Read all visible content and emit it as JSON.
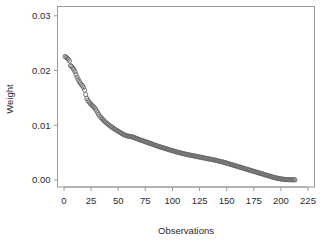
{
  "chart_data": {
    "type": "scatter",
    "title": "",
    "xlabel": "Observations",
    "ylabel": "Weight",
    "xlim": [
      -6,
      231
    ],
    "ylim": [
      -0.0013,
      0.0317
    ],
    "xticks": [
      0,
      25,
      50,
      75,
      100,
      125,
      150,
      175,
      200,
      225
    ],
    "xticklabels": [
      "0",
      "25",
      "50",
      "75",
      "100",
      "125",
      "150",
      "175",
      "200",
      "225"
    ],
    "yticks": [
      0.0,
      0.01,
      0.02,
      0.03
    ],
    "yticklabels": [
      "0.00",
      "0.01",
      "0.02",
      "0.03"
    ],
    "grid": false,
    "legend": null,
    "marker": "open-circle",
    "marker_color": "#6b6b6b",
    "marker_size": 2.1,
    "frame_color": "#9a9a9a",
    "text_color": "#2b2b2b",
    "n_points": 213,
    "x": [
      1,
      2,
      3,
      4,
      5,
      6,
      7,
      8,
      9,
      10,
      11,
      12,
      13,
      14,
      15,
      16,
      17,
      18,
      19,
      20,
      21,
      22,
      23,
      24,
      25,
      26,
      27,
      28,
      29,
      30,
      31,
      32,
      33,
      34,
      35,
      36,
      37,
      38,
      39,
      40,
      41,
      42,
      43,
      44,
      45,
      46,
      47,
      48,
      49,
      50,
      51,
      52,
      53,
      54,
      55,
      56,
      57,
      58,
      59,
      60,
      61,
      62,
      63,
      64,
      65,
      66,
      67,
      68,
      69,
      70,
      71,
      72,
      73,
      74,
      75,
      76,
      77,
      78,
      79,
      80,
      81,
      82,
      83,
      84,
      85,
      86,
      87,
      88,
      89,
      90,
      91,
      92,
      93,
      94,
      95,
      96,
      97,
      98,
      99,
      100,
      101,
      102,
      103,
      104,
      105,
      106,
      107,
      108,
      109,
      110,
      111,
      112,
      113,
      114,
      115,
      116,
      117,
      118,
      119,
      120,
      121,
      122,
      123,
      124,
      125,
      126,
      127,
      128,
      129,
      130,
      131,
      132,
      133,
      134,
      135,
      136,
      137,
      138,
      139,
      140,
      141,
      142,
      143,
      144,
      145,
      146,
      147,
      148,
      149,
      150,
      151,
      152,
      153,
      154,
      155,
      156,
      157,
      158,
      159,
      160,
      161,
      162,
      163,
      164,
      165,
      166,
      167,
      168,
      169,
      170,
      171,
      172,
      173,
      174,
      175,
      176,
      177,
      178,
      179,
      180,
      181,
      182,
      183,
      184,
      185,
      186,
      187,
      188,
      189,
      190,
      191,
      192,
      193,
      194,
      195,
      196,
      197,
      198,
      199,
      200,
      201,
      202,
      203,
      204,
      205,
      206,
      207,
      208,
      209,
      210,
      211,
      212,
      213
    ],
    "y": [
      0.02255,
      0.0224,
      0.02225,
      0.02205,
      0.02175,
      0.0209,
      0.02075,
      0.0205,
      0.0202,
      0.0198,
      0.0193,
      0.0188,
      0.0184,
      0.018,
      0.0177,
      0.01745,
      0.0172,
      0.0169,
      0.0164,
      0.0156,
      0.0149,
      0.01455,
      0.01425,
      0.014,
      0.0138,
      0.0136,
      0.0134,
      0.0132,
      0.01295,
      0.01265,
      0.0123,
      0.01195,
      0.01165,
      0.0114,
      0.0112,
      0.011,
      0.0108,
      0.0106,
      0.01042,
      0.01026,
      0.0101,
      0.00995,
      0.0098,
      0.00966,
      0.00952,
      0.00938,
      0.00925,
      0.00912,
      0.009,
      0.00888,
      0.00876,
      0.00864,
      0.00852,
      0.00841,
      0.0083,
      0.0082,
      0.00812,
      0.00806,
      0.00802,
      0.00798,
      0.00794,
      0.0079,
      0.00786,
      0.0078,
      0.00772,
      0.00764,
      0.00756,
      0.00748,
      0.0074,
      0.00733,
      0.00726,
      0.00719,
      0.00712,
      0.00705,
      0.00698,
      0.00691,
      0.00684,
      0.00677,
      0.0067,
      0.00663,
      0.00656,
      0.00649,
      0.00642,
      0.00635,
      0.00628,
      0.00621,
      0.00614,
      0.00607,
      0.006,
      0.00594,
      0.00588,
      0.00582,
      0.00576,
      0.0057,
      0.00564,
      0.00558,
      0.00552,
      0.00546,
      0.0054,
      0.00534,
      0.00528,
      0.00522,
      0.00516,
      0.0051,
      0.00505,
      0.005,
      0.00495,
      0.0049,
      0.00485,
      0.0048,
      0.00475,
      0.0047,
      0.00466,
      0.00462,
      0.00458,
      0.00454,
      0.0045,
      0.00446,
      0.00442,
      0.00438,
      0.00434,
      0.0043,
      0.00426,
      0.00422,
      0.00418,
      0.00414,
      0.0041,
      0.00406,
      0.00402,
      0.00398,
      0.00394,
      0.0039,
      0.00386,
      0.00382,
      0.00378,
      0.00374,
      0.0037,
      0.00366,
      0.00362,
      0.00358,
      0.00353,
      0.00348,
      0.00343,
      0.00338,
      0.00333,
      0.00328,
      0.00323,
      0.00318,
      0.00312,
      0.00306,
      0.003,
      0.00294,
      0.00288,
      0.00282,
      0.00276,
      0.0027,
      0.00264,
      0.00258,
      0.00252,
      0.00246,
      0.0024,
      0.00234,
      0.00228,
      0.00222,
      0.00216,
      0.0021,
      0.00204,
      0.00198,
      0.00192,
      0.00186,
      0.0018,
      0.00174,
      0.00168,
      0.00162,
      0.00156,
      0.0015,
      0.00144,
      0.00138,
      0.00132,
      0.00126,
      0.0012,
      0.00114,
      0.00108,
      0.00102,
      0.00096,
      0.0009,
      0.00084,
      0.00078,
      0.00072,
      0.00066,
      0.0006,
      0.00054,
      0.00048,
      0.00043,
      0.00038,
      0.00033,
      0.00029,
      0.00025,
      0.00021,
      0.00018,
      0.00015,
      0.00012,
      0.0001,
      8e-05,
      7e-05,
      6e-05,
      5e-05,
      4e-05,
      3e-05,
      2e-05,
      2e-05,
      1e-05,
      1e-05
    ]
  }
}
